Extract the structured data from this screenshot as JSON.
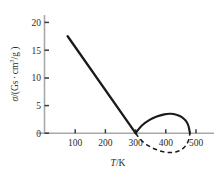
{
  "chart_data": {
    "type": "line",
    "title": "",
    "xlabel": "T/K",
    "ylabel": "σ/(Gs·cm³/g)",
    "xlabel_parts": {
      "symbol": "T",
      "separator": "/",
      "unit": "K"
    },
    "ylabel_parts": {
      "symbol": "σ",
      "separator": "/(",
      "unit_a": "Gs",
      "dot": "·",
      "unit_b": "cm",
      "exponent": "3",
      "unit_c": "/g )"
    },
    "xlim": [
      0,
      560
    ],
    "ylim": [
      0,
      21
    ],
    "ylim_display": [
      -4.2,
      21
    ],
    "xticks": [
      100,
      200,
      300,
      400,
      500
    ],
    "xticklabels": [
      "100",
      "200",
      "300",
      "400",
      "500"
    ],
    "yticks": [
      0,
      5,
      10,
      15,
      20
    ],
    "yticklabels": [
      "0",
      "5",
      "10",
      "15",
      "20"
    ],
    "grid": false,
    "legend": false,
    "legend_position": "none",
    "axis_color": "#a8a8a8",
    "curve_color": "#1a1a1a",
    "series": [
      {
        "name": "linear-decay",
        "style": "solid",
        "x": [
          75,
          300
        ],
        "values": [
          17.5,
          0
        ],
        "comment": "straight descending segment"
      },
      {
        "name": "upper-arc",
        "style": "solid",
        "x": [
          300,
          320,
          345,
          370,
          395,
          415,
          435,
          452,
          466,
          475,
          480
        ],
        "values": [
          0,
          1.35,
          2.35,
          3.0,
          3.4,
          3.5,
          3.35,
          2.95,
          2.25,
          1.3,
          0
        ],
        "peak_x": 415,
        "peak_y": 3.5
      },
      {
        "name": "lower-arc",
        "style": "dashed",
        "x": [
          300,
          320,
          345,
          370,
          395,
          415,
          435,
          452,
          466,
          475,
          480
        ],
        "values": [
          0,
          -1.35,
          -2.35,
          -3.0,
          -3.4,
          -3.5,
          -3.35,
          -2.95,
          -2.25,
          -1.3,
          0
        ],
        "trough_x": 415,
        "trough_y": -3.5
      }
    ],
    "annotations": []
  }
}
